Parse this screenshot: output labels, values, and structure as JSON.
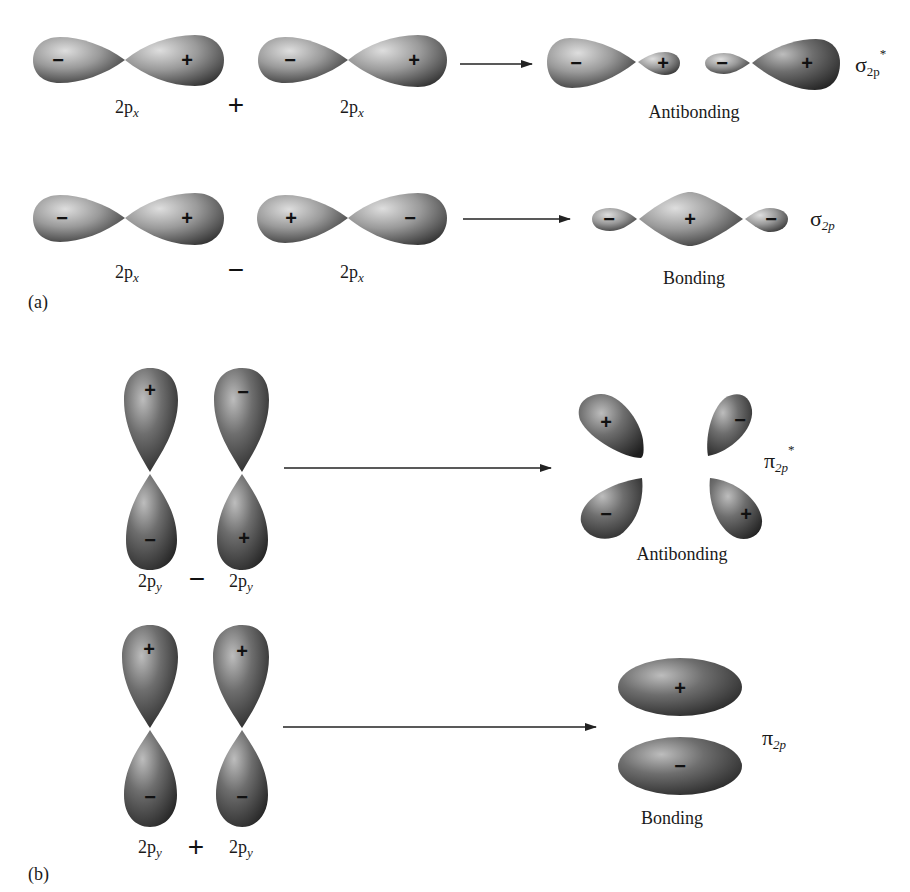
{
  "panel_a": {
    "label": "(a)",
    "row1": {
      "left_label": "2p",
      "left_sub": "x",
      "operator": "+",
      "right_label": "2p",
      "right_sub": "x",
      "orbital1_signs": [
        "−",
        "+"
      ],
      "orbital2_signs": [
        "−",
        "+"
      ],
      "result_signs": [
        "−",
        "+",
        "−",
        "+"
      ],
      "result_caption": "Antibonding",
      "mo_symbol": "σ",
      "mo_sub": "2p",
      "mo_sup": "*"
    },
    "row2": {
      "left_label": "2p",
      "left_sub": "x",
      "operator": "−",
      "right_label": "2p",
      "right_sub": "x",
      "orbital1_signs": [
        "−",
        "+"
      ],
      "orbital2_signs": [
        "+",
        "−"
      ],
      "result_signs": [
        "−",
        "+",
        "−"
      ],
      "result_caption": "Bonding",
      "mo_symbol": "σ",
      "mo_sub": "2p",
      "mo_sup": ""
    }
  },
  "panel_b": {
    "label": "(b)",
    "row1": {
      "left_label": "2p",
      "left_sub": "y",
      "operator": "−",
      "right_label": "2p",
      "right_sub": "y",
      "orbital1_signs": [
        "+",
        "−"
      ],
      "orbital2_signs": [
        "−",
        "+"
      ],
      "result_signs": [
        "+",
        "−",
        "−",
        "+"
      ],
      "result_caption": "Antibonding",
      "mo_symbol": "π",
      "mo_sub": "2p",
      "mo_sup": "*"
    },
    "row2": {
      "left_label": "2p",
      "left_sub": "y",
      "operator": "+",
      "right_label": "2p",
      "right_sub": "y",
      "orbital1_signs": [
        "+",
        "−"
      ],
      "orbital2_signs": [
        "+",
        "−"
      ],
      "result_signs": [
        "+",
        "−"
      ],
      "result_caption": "Bonding",
      "mo_symbol": "π",
      "mo_sub": "2p",
      "mo_sup": ""
    }
  },
  "colors": {
    "lobe_light": "#d9d9d9",
    "lobe_mid": "#8a8a8a",
    "lobe_dark": "#2e2e2e",
    "text": "#1a1a1a",
    "background": "#ffffff"
  }
}
